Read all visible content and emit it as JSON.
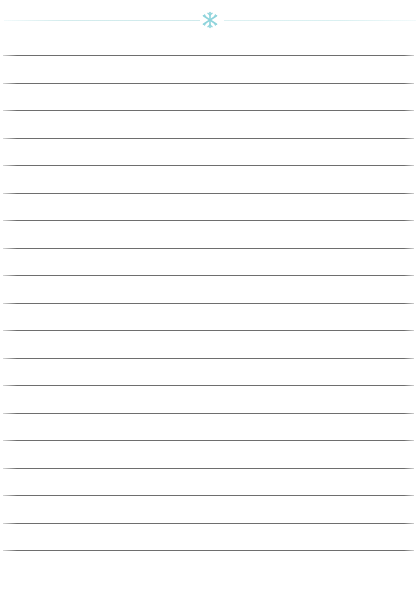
{
  "page": {
    "width": 420,
    "height": 591,
    "background_color": "#ffffff"
  },
  "header": {
    "ornament_icon": "snowflake-icon",
    "ornament_color": "#8fd4dc",
    "rule_color": "#d8eef0",
    "rule_y": 20,
    "ornament_center_x": 212,
    "ornament_center_y": 20
  },
  "ruled_lines": {
    "color": "#6e6e6e",
    "thickness_px": 1,
    "left_x": 3,
    "right_x": 414,
    "first_line_y": 55,
    "spacing_px": 27.5,
    "count": 19,
    "y_positions": [
      55,
      82.5,
      110,
      137.5,
      165,
      192.5,
      220,
      247.5,
      275,
      302.5,
      330,
      357.5,
      385,
      412.5,
      440,
      467.5,
      495,
      522.5,
      550
    ]
  }
}
